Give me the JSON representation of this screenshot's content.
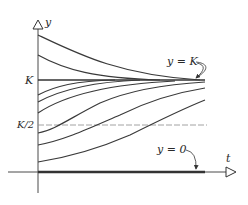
{
  "diagram": {
    "type": "logistic-solution-curves",
    "axes": {
      "x_label": "t",
      "y_label": "y"
    },
    "levels": {
      "K_label": "K",
      "half_K_label": "K/2"
    },
    "annotations": {
      "equilibrium_K": "y = K",
      "equilibrium_zero": "y = 0"
    },
    "colors": {
      "curve": "#3a3a3a",
      "axis": "#4a4a4a",
      "dashed": "#8a8a8a",
      "background": "#ffffff"
    },
    "curves_above_K": 2,
    "curves_below_K": 6
  }
}
